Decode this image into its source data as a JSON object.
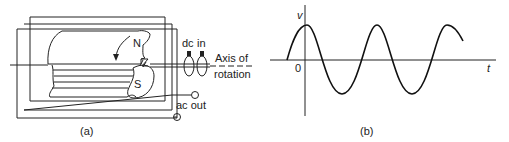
{
  "figure_a": {
    "caption": "(a)",
    "pole_north": "N",
    "pole_south": "S",
    "dc_label": "dc",
    "in_label": "in",
    "axis_label_line1": "Axis of",
    "axis_label_line2": "rotation",
    "ac_out_label": "ac out"
  },
  "figure_b": {
    "caption": "(b)",
    "y_axis_label": "v",
    "x_axis_label": "t",
    "origin_label": "0"
  },
  "colors": {
    "ink": "#222222",
    "background": "#ffffff"
  }
}
